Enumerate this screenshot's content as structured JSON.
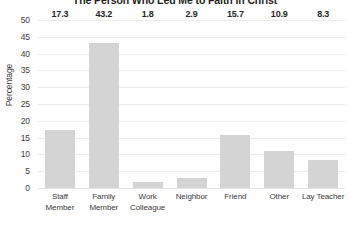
{
  "chart_data": {
    "type": "bar",
    "title": "The Person Who Led Me to Faith in Christ",
    "xlabel": "",
    "ylabel": "Percentage",
    "categories": [
      "Staff Member",
      "Family Member",
      "Work Colleague",
      "Neighbor",
      "Friend",
      "Other",
      "Lay Teacher"
    ],
    "category_lines": [
      [
        "Staff",
        "Member"
      ],
      [
        "Family",
        "Member"
      ],
      [
        "Work",
        "Colleague"
      ],
      [
        "Neighbor"
      ],
      [
        "Friend"
      ],
      [
        "Other"
      ],
      [
        "Lay Teacher"
      ]
    ],
    "values": [
      17.3,
      43.2,
      1.8,
      2.9,
      15.7,
      10.9,
      8.3
    ],
    "value_labels": [
      "17.3",
      "43.2",
      "1.8",
      "2.9",
      "15.7",
      "10.9",
      "8.3"
    ],
    "ylim": [
      0,
      50
    ],
    "ytick_values": [
      50,
      45,
      40,
      35,
      30,
      25,
      20,
      15,
      10,
      5,
      0
    ],
    "ytick_labels": [
      "50",
      "45",
      "40",
      "35",
      "30",
      "25",
      "20",
      "15",
      "10",
      "5",
      "0"
    ],
    "grid": true,
    "legend": false,
    "bar_color": "#d4d4d4",
    "gridline_color": "#ebebeb",
    "text_color": "#3b3b3b",
    "title_color": "#231f20"
  }
}
